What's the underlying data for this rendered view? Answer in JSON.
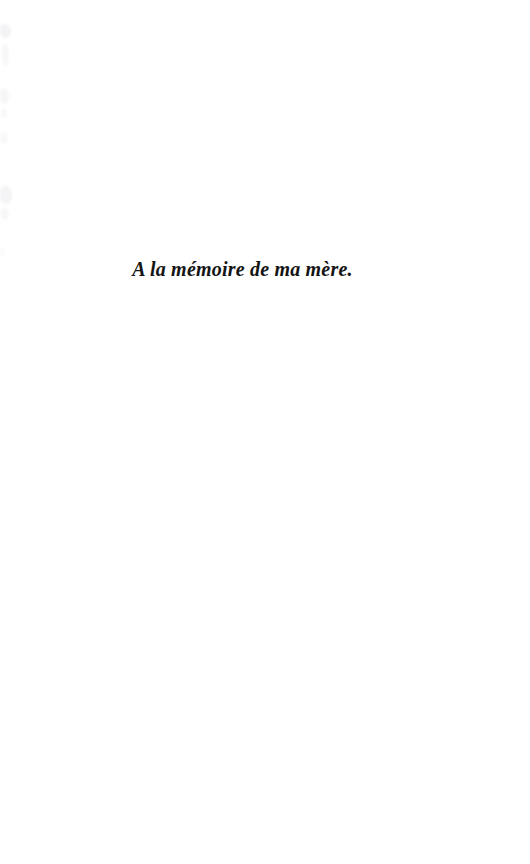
{
  "page": {
    "kind": "book-dedication-page",
    "background_color": "#ffffff",
    "width": 530,
    "height": 864
  },
  "dedication": {
    "text": "A la mémoire de ma mère.",
    "language": "fr",
    "text_color": "#141414",
    "style": "bold-italic-serif",
    "alignment": "center"
  },
  "artifacts": {
    "description": "faint gray scan smudges along left edge",
    "color": "#f2f2f4"
  }
}
